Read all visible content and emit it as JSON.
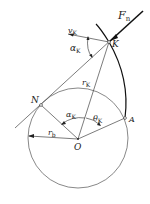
{
  "diagram": {
    "points": {
      "K": {
        "label": "K",
        "x": 109,
        "y": 42
      },
      "N": {
        "label": "N",
        "x": 41,
        "y": 105
      },
      "O": {
        "label": "O",
        "x": 78,
        "y": 139
      },
      "A": {
        "label": "A",
        "x": 125,
        "y": 118
      }
    },
    "base_circle": {
      "cx": 78,
      "cy": 138,
      "r": 50
    },
    "labels": {
      "force": "F",
      "force_sub": "n",
      "velocity": "v",
      "velocity_sub": "K",
      "alpha_top": "α",
      "alpha_top_sub": "K",
      "radius_k": "r",
      "radius_k_sub": "K",
      "alpha_center": "α",
      "alpha_center_sub": "K",
      "theta": "θ",
      "theta_sub": "K",
      "radius_b": "r",
      "radius_b_sub": "b",
      "point_N": "N",
      "point_O": "O",
      "point_A": "A",
      "point_K": "K"
    },
    "colors": {
      "line": "#444444",
      "bold": "#111111",
      "text": "#222222"
    }
  }
}
